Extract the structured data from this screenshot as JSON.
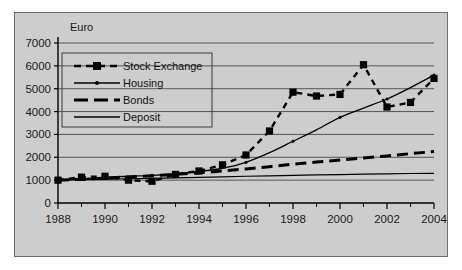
{
  "chart_data": {
    "type": "line",
    "title": "",
    "xlabel": "",
    "ylabel": "Euro",
    "unit_label": "Euro",
    "x": [
      1988,
      1989,
      1990,
      1991,
      1992,
      1993,
      1994,
      1995,
      1996,
      1997,
      1998,
      1999,
      2000,
      2001,
      2002,
      2003,
      2004
    ],
    "xlim": [
      1988,
      2004
    ],
    "ylim": [
      0,
      7000
    ],
    "ytick_labels": [
      "7000",
      "6000",
      "5000",
      "4000",
      "3000",
      "2000",
      "1000",
      "0"
    ],
    "yticks": [
      7000,
      6000,
      5000,
      4000,
      3000,
      2000,
      1000,
      0
    ],
    "xtick_labels": [
      "1988",
      "1990",
      "1992",
      "1994",
      "1996",
      "1998",
      "2000",
      "2002",
      "2004"
    ],
    "xticks": [
      1988,
      1990,
      1992,
      1994,
      1996,
      1998,
      2000,
      2002,
      2004
    ],
    "xtick_minor_every": 1,
    "grid": "horizontal",
    "legend_position": "upper-left-inside",
    "series": [
      {
        "name": "Stock Exchange",
        "style": "dashed-with-square-markers",
        "color": "#000000",
        "values": [
          1000,
          1130,
          1170,
          1000,
          950,
          1250,
          1400,
          1670,
          2100,
          3150,
          4850,
          4680,
          4750,
          6050,
          4200,
          4400,
          5450
        ]
      },
      {
        "name": "Housing",
        "style": "thin-solid-with-dot-markers",
        "color": "#000000",
        "values": [
          1000,
          1060,
          1120,
          1170,
          1210,
          1280,
          1380,
          1520,
          1780,
          2200,
          2700,
          3200,
          3750,
          4150,
          4550,
          5050,
          5600
        ]
      },
      {
        "name": "Bonds",
        "style": "heavy-dashed",
        "color": "#000000",
        "values": [
          1000,
          1040,
          1090,
          1140,
          1190,
          1250,
          1320,
          1400,
          1490,
          1590,
          1700,
          1790,
          1880,
          1970,
          2060,
          2160,
          2250
        ]
      },
      {
        "name": "Deposit",
        "style": "thin-solid",
        "color": "#000000",
        "values": [
          1000,
          1020,
          1040,
          1060,
          1080,
          1100,
          1120,
          1145,
          1170,
          1190,
          1210,
          1230,
          1245,
          1260,
          1275,
          1290,
          1300
        ]
      }
    ],
    "colors": {
      "panel_background": "#cdcdcd",
      "page_background": "#ffffff",
      "axis": "#000000",
      "gridline": "#555555",
      "text": "#1a1a1a"
    }
  },
  "legend": {
    "items": [
      {
        "label": "Stock Exchange"
      },
      {
        "label": "Housing"
      },
      {
        "label": "Bonds"
      },
      {
        "label": "Deposit"
      }
    ]
  }
}
